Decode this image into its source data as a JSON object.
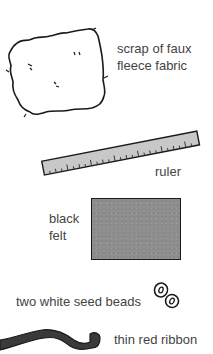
{
  "items": [
    {
      "id": "fleece",
      "label_lines": [
        "scrap of faux",
        "fleece fabric"
      ],
      "icon": "fleece-scrap-icon"
    },
    {
      "id": "ruler",
      "label_lines": [
        "ruler"
      ],
      "icon": "ruler-icon"
    },
    {
      "id": "felt",
      "label_lines": [
        "black",
        "felt"
      ],
      "icon": "felt-square-icon"
    },
    {
      "id": "beads",
      "label_lines": [
        "two white seed beads"
      ],
      "icon": "seed-beads-icon"
    },
    {
      "id": "ribbon",
      "label_lines": [
        "thin red ribbon"
      ],
      "icon": "ribbon-icon"
    }
  ],
  "colors": {
    "ink": "#1a1a1a",
    "ruler_fill": "#c8c8c8",
    "felt_fill": "#8f8f8f",
    "ribbon_fill": "#3a3a3a",
    "text": "#444444"
  }
}
